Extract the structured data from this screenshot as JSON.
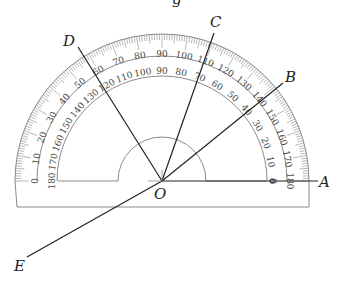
{
  "figure": {
    "type": "protractor-angle-diagram",
    "top_fragment": "g",
    "center_label": "O",
    "points": [
      {
        "label": "A",
        "angle_deg": 0
      },
      {
        "label": "B",
        "angle_deg": 37
      },
      {
        "label": "C",
        "angle_deg": 70
      },
      {
        "label": "D",
        "angle_deg": 120
      },
      {
        "label": "E",
        "angle_deg": 217
      }
    ],
    "outer_scale": [
      "0",
      "10",
      "20",
      "30",
      "40",
      "50",
      "60",
      "70",
      "80",
      "90",
      "100",
      "110",
      "120",
      "130",
      "140",
      "150",
      "160",
      "170",
      "180"
    ],
    "inner_scale": [
      "180",
      "170",
      "160",
      "150",
      "140",
      "130",
      "120",
      "110",
      "100",
      "90",
      "80",
      "70",
      "60",
      "50",
      "40",
      "30",
      "20",
      "10",
      "0"
    ],
    "colors": {
      "line": "#222222",
      "scale": "#8a8a8a",
      "text": "#444444"
    }
  }
}
